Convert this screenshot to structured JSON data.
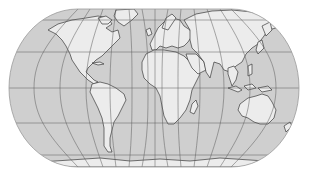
{
  "map": {
    "title": "World map",
    "projection": "Eckert-style pseudocylindrical",
    "colors": {
      "background": "#ffffff",
      "ocean": "#cfcfcf",
      "land": "#ececec",
      "coastline": "#3a3a3a",
      "graticule": "#5a5a5a"
    },
    "graticule": {
      "parallels_y": [
        20,
        52,
        88,
        123,
        155
      ],
      "meridian_count": 12
    },
    "regions": [
      "North America",
      "South America",
      "Europe",
      "Africa",
      "Asia",
      "Australia",
      "Greenland",
      "Antarctica",
      "New Zealand",
      "Madagascar",
      "Japan",
      "Indonesia"
    ]
  }
}
